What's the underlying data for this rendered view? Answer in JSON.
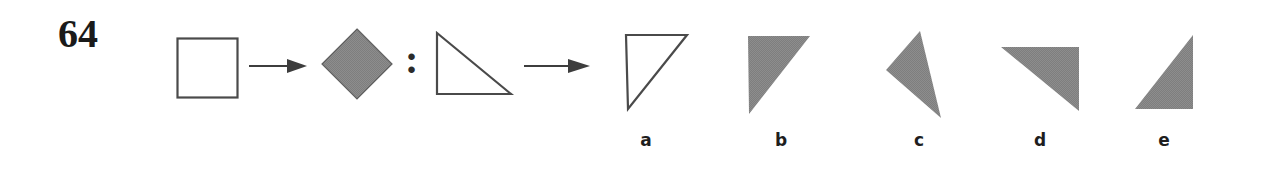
{
  "item": {
    "number": "64",
    "type": "figural-analogy",
    "relation_separator": ":"
  },
  "colors": {
    "figure_fill": "#808080",
    "figure_stroke": "#4a4a4a",
    "arrow": "#3d3d3d",
    "text": "#1a1a1a",
    "background": "#ffffff"
  },
  "stem": {
    "pair_a": {
      "source": {
        "name": "square-outline",
        "shape": "square",
        "fill": "none",
        "stroke": "#4a4a4a",
        "x": 178,
        "y": 39,
        "width": 60,
        "height": 59
      },
      "arrow": {
        "name": "arrow-right-1",
        "x": 249,
        "y": 58,
        "width": 58,
        "height": 16
      },
      "target": {
        "name": "diamond-filled",
        "shape": "diamond",
        "fill": "#808080",
        "stroke": "#5a5a5a",
        "x": 322,
        "y": 29,
        "width": 70,
        "height": 70
      }
    },
    "pair_b": {
      "source": {
        "name": "right-triangle-outline",
        "shape": "right-triangle",
        "fill": "none",
        "stroke": "#4a4a4a",
        "right_angle": "bottom-left",
        "x": 436,
        "y": 32,
        "width": 76,
        "height": 62
      },
      "arrow": {
        "name": "arrow-right-2",
        "x": 524,
        "y": 58,
        "width": 66,
        "height": 16
      },
      "target": {
        "name": "answer-blank",
        "shape": "unknown"
      }
    }
  },
  "options": [
    {
      "label": "a",
      "name": "option-a",
      "shape": "right-triangle",
      "fill": "none",
      "stroke": "#4a4a4a",
      "right_angle": "top-left",
      "label_x": 646,
      "box": {
        "x": 625,
        "y": 34,
        "width": 62,
        "height": 76
      }
    },
    {
      "label": "b",
      "name": "option-b",
      "shape": "right-triangle",
      "fill": "#808080",
      "stroke": "none",
      "right_angle": "top-left",
      "label_x": 781,
      "box": {
        "x": 748,
        "y": 36,
        "width": 62,
        "height": 78
      }
    },
    {
      "label": "c",
      "name": "option-c",
      "shape": "scalene-triangle",
      "fill": "#808080",
      "stroke": "none",
      "rotated": true,
      "label_x": 919,
      "box": {
        "x": 886,
        "y": 31,
        "width": 57,
        "height": 87
      }
    },
    {
      "label": "d",
      "name": "option-d",
      "shape": "right-triangle",
      "fill": "#808080",
      "stroke": "none",
      "right_angle": "top-right",
      "label_x": 1040,
      "box": {
        "x": 1001,
        "y": 47,
        "width": 78,
        "height": 64
      }
    },
    {
      "label": "e",
      "name": "option-e",
      "shape": "right-triangle",
      "fill": "#808080",
      "stroke": "none",
      "right_angle": "bottom-right",
      "label_x": 1164,
      "box": {
        "x": 1135,
        "y": 35,
        "width": 58,
        "height": 74
      }
    }
  ]
}
